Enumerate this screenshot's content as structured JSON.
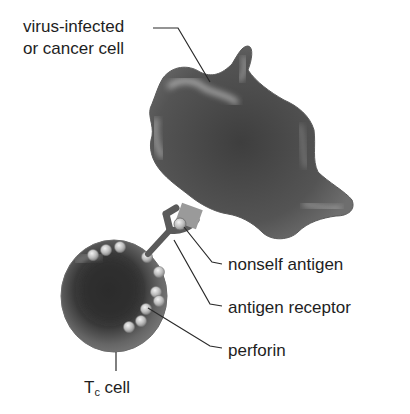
{
  "diagram": {
    "labels": {
      "target_cell_line1": "virus-infected",
      "target_cell_line2": "or cancer cell",
      "nonself_antigen": "nonself antigen",
      "antigen_receptor": "antigen receptor",
      "perforin": "perforin",
      "tc_cell_main": "T",
      "tc_cell_sub": "c",
      "tc_cell_suffix": " cell"
    },
    "colors": {
      "cell_fill": "#5e5e5e",
      "cell_dark": "#3e3e3e",
      "highlight": "#d8d8d8",
      "receptor": "#6a6a6a",
      "antigen": "#9a9a9a",
      "leader_line": "#2a2a2a",
      "background": "#ffffff"
    }
  }
}
